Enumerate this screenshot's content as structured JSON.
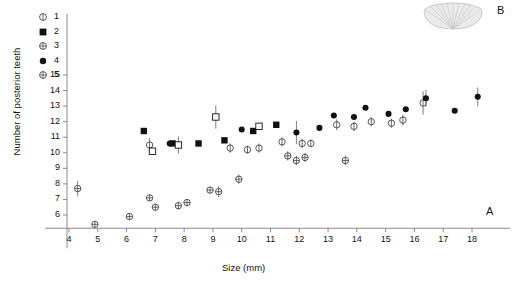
{
  "figure": {
    "panel_a_label": "A",
    "panel_b_label": "B",
    "panel_b_icon": "fan-shell-illustration"
  },
  "chart_data": {
    "type": "scatter",
    "title": "",
    "xlabel": "Size (mm)",
    "ylabel": "Number of posterior teeth",
    "xlim": [
      3.3,
      18.9
    ],
    "ylim": [
      4.6,
      15.6
    ],
    "xticks": [
      4,
      5,
      6,
      7,
      8,
      9,
      10,
      11,
      12,
      13,
      14,
      15,
      16,
      17,
      18
    ],
    "yticks": [
      6,
      7,
      8,
      9,
      10,
      11,
      12,
      13,
      14,
      15
    ],
    "grid": false,
    "legend_position": "top-left",
    "error_bars": "vertical",
    "series": [
      {
        "name": "1",
        "marker": "open-circle-with-bar",
        "points": [
          {
            "x": 6.8,
            "y": 10.5,
            "err": 0.45
          },
          {
            "x": 9.6,
            "y": 10.3,
            "err": 0.3
          },
          {
            "x": 10.2,
            "y": 10.2,
            "err": 0.25
          },
          {
            "x": 10.6,
            "y": 10.3,
            "err": 0.3
          },
          {
            "x": 11.4,
            "y": 10.7,
            "err": 0.3
          },
          {
            "x": 12.1,
            "y": 10.6,
            "err": 0.3
          },
          {
            "x": 12.4,
            "y": 10.6,
            "err": 0.25
          },
          {
            "x": 13.3,
            "y": 11.8,
            "err": 0.35
          },
          {
            "x": 13.9,
            "y": 11.7,
            "err": 0.3
          },
          {
            "x": 14.5,
            "y": 12.0,
            "err": 0.3
          },
          {
            "x": 15.2,
            "y": 11.9,
            "err": 0.3
          },
          {
            "x": 15.6,
            "y": 12.1,
            "err": 0.35
          },
          {
            "x": 16.3,
            "y": 13.2,
            "err": 0.75
          }
        ]
      },
      {
        "name": "2",
        "marker": "filled-square",
        "points": [
          {
            "x": 6.6,
            "y": 11.4,
            "err": 0
          },
          {
            "x": 7.6,
            "y": 10.6,
            "err": 0
          },
          {
            "x": 8.5,
            "y": 10.6,
            "err": 0
          },
          {
            "x": 9.4,
            "y": 10.8,
            "err": 0
          },
          {
            "x": 10.4,
            "y": 11.4,
            "err": 0
          },
          {
            "x": 11.2,
            "y": 11.8,
            "err": 0
          }
        ]
      },
      {
        "name": "3",
        "marker": "open-square",
        "points": [
          {
            "x": 6.9,
            "y": 10.1,
            "err": 0
          },
          {
            "x": 7.8,
            "y": 10.5,
            "err": 0.55
          },
          {
            "x": 9.1,
            "y": 12.3,
            "err": 0.75
          },
          {
            "x": 10.6,
            "y": 11.7,
            "err": 0
          }
        ]
      },
      {
        "name": "4",
        "marker": "filled-diamond",
        "points": [
          {
            "x": 7.5,
            "y": 10.6,
            "err": 0
          },
          {
            "x": 10.0,
            "y": 11.5,
            "err": 0
          },
          {
            "x": 11.9,
            "y": 11.3,
            "err": 0.75
          },
          {
            "x": 12.7,
            "y": 11.6,
            "err": 0
          },
          {
            "x": 13.2,
            "y": 12.4,
            "err": 0
          },
          {
            "x": 13.9,
            "y": 12.3,
            "err": 0
          },
          {
            "x": 14.3,
            "y": 12.9,
            "err": 0
          },
          {
            "x": 15.1,
            "y": 12.5,
            "err": 0
          },
          {
            "x": 15.7,
            "y": 12.8,
            "err": 0
          },
          {
            "x": 16.4,
            "y": 13.5,
            "err": 0.55
          },
          {
            "x": 17.4,
            "y": 12.7,
            "err": 0
          },
          {
            "x": 18.2,
            "y": 13.6,
            "err": 0.6
          }
        ]
      },
      {
        "name": "5",
        "marker": "open-circle-with-cross",
        "points": [
          {
            "x": 4.3,
            "y": 7.7,
            "err": 0.5
          },
          {
            "x": 4.9,
            "y": 5.4,
            "err": 0
          },
          {
            "x": 6.1,
            "y": 5.9,
            "err": 0
          },
          {
            "x": 7.0,
            "y": 6.5,
            "err": 0
          },
          {
            "x": 6.8,
            "y": 7.1,
            "err": 0
          },
          {
            "x": 7.8,
            "y": 6.6,
            "err": 0.25
          },
          {
            "x": 8.1,
            "y": 6.8,
            "err": 0
          },
          {
            "x": 8.9,
            "y": 7.6,
            "err": 0
          },
          {
            "x": 9.2,
            "y": 7.5,
            "err": 0.35
          },
          {
            "x": 9.9,
            "y": 8.3,
            "err": 0.3
          },
          {
            "x": 11.6,
            "y": 9.8,
            "err": 0.3
          },
          {
            "x": 11.9,
            "y": 9.5,
            "err": 0.3
          },
          {
            "x": 12.2,
            "y": 9.7,
            "err": 0.3
          },
          {
            "x": 13.6,
            "y": 9.5,
            "err": 0.3
          }
        ]
      }
    ]
  },
  "legend": {
    "items": [
      {
        "label": "1",
        "marker": "open-circle-with-bar"
      },
      {
        "label": "2",
        "marker": "filled-square"
      },
      {
        "label": "3",
        "marker": "open-circle-with-cross"
      },
      {
        "label": "4",
        "marker": "filled-diamond"
      },
      {
        "label": "5",
        "marker": "open-circle-with-cross"
      }
    ]
  }
}
